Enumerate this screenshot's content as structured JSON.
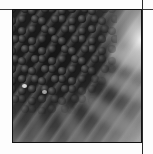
{
  "image": {
    "subject": "coneflower-center-closeup",
    "tone": "grayscale",
    "frame_border_color": "#111111",
    "rule_color": "#3a3a3a",
    "background_color": "#ffffff",
    "highlight_spots": [
      {
        "x": 9,
        "y": 74
      },
      {
        "x": 29,
        "y": 80
      }
    ]
  }
}
